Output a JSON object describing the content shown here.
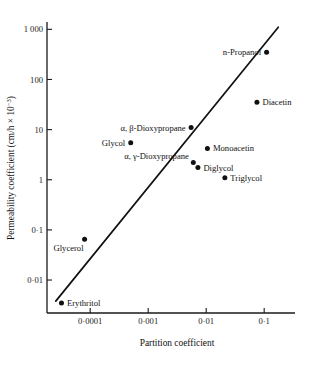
{
  "chart_data": {
    "type": "scatter",
    "title": "",
    "xlabel": "Partition coefficient",
    "ylabel": "Permeability coefficient (cm/h × 10⁻³)",
    "xscale": "log",
    "yscale": "log",
    "xlim": [
      1.8e-05,
      0.34
    ],
    "ylim": [
      0.0022,
      1400
    ],
    "grid": false,
    "legend": "none",
    "xticks": [
      0.0001,
      0.001,
      0.01,
      0.1
    ],
    "xticklabels": [
      "0·0001",
      "0·001",
      "0·01",
      "0·1"
    ],
    "yticks": [
      0.01,
      0.1,
      1,
      10,
      100,
      1000
    ],
    "yticklabels": [
      "0·01",
      "0·1",
      "1",
      "10",
      "100",
      "1 000"
    ],
    "points": [
      {
        "label": "Erythritol",
        "x": 3.2e-05,
        "y": 0.0035,
        "label_pos": "right"
      },
      {
        "label": "Glycerol",
        "x": 8e-05,
        "y": 0.065,
        "label_pos": "below-left"
      },
      {
        "label": "Glycol",
        "x": 0.0005,
        "y": 5.5,
        "label_pos": "left"
      },
      {
        "label": "α, β-Dioxypropane",
        "x": 0.0055,
        "y": 11.0,
        "label_pos": "left"
      },
      {
        "label": "α, γ-Dioxypropane",
        "x": 0.006,
        "y": 2.2,
        "label_pos": "left-above"
      },
      {
        "label": "Diglycol",
        "x": 0.0072,
        "y": 1.75,
        "label_pos": "right"
      },
      {
        "label": "Monoacetin",
        "x": 0.0105,
        "y": 4.2,
        "label_pos": "right"
      },
      {
        "label": "Triglycol",
        "x": 0.021,
        "y": 1.1,
        "label_pos": "right"
      },
      {
        "label": "Diacetin",
        "x": 0.075,
        "y": 35.0,
        "label_pos": "right"
      },
      {
        "label": "n-Propanol",
        "x": 0.11,
        "y": 350.0,
        "label_pos": "left"
      }
    ],
    "trendline": {
      "描述": "",
      "x_start": 2.55e-05,
      "y_start": 0.0038,
      "x_end": 0.175,
      "y_end": 1100
    }
  }
}
